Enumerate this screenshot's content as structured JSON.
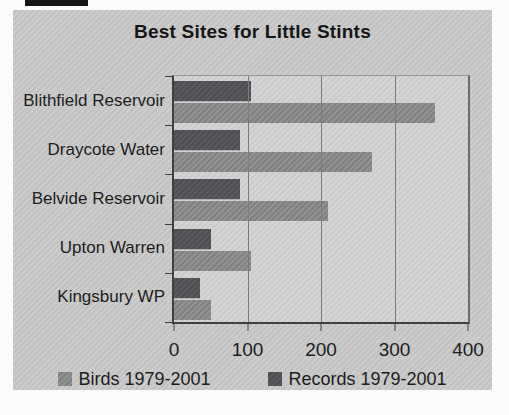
{
  "window": {
    "background": "#fbfbfb",
    "panel_background": "#c9c9c9"
  },
  "chart_data": {
    "type": "bar",
    "orientation": "horizontal",
    "title": "Best Sites for Little Stints",
    "categories": [
      "Blithfield Reservoir",
      "Draycote Water",
      "Belvide Reservoir",
      "Upton Warren",
      "Kingsbury WP"
    ],
    "series": [
      {
        "name": "Birds 1979-2001",
        "color": "#929292",
        "hatch_color": "#808080",
        "values": [
          355,
          270,
          210,
          105,
          50
        ]
      },
      {
        "name": "Records 1979-2001",
        "color": "#58585d",
        "hatch_color": "#4d4d52",
        "values": [
          105,
          90,
          90,
          50,
          35
        ]
      }
    ],
    "xlim": [
      0,
      400
    ],
    "xticks": [
      0,
      100,
      200,
      300,
      400
    ],
    "grid": true,
    "legend_position": "bottom",
    "plot_background": "#d2d2d2",
    "gridline_color": "#7b7b7b",
    "axis_color": "#3f3f3f",
    "text_color": "#1d1d1d"
  }
}
